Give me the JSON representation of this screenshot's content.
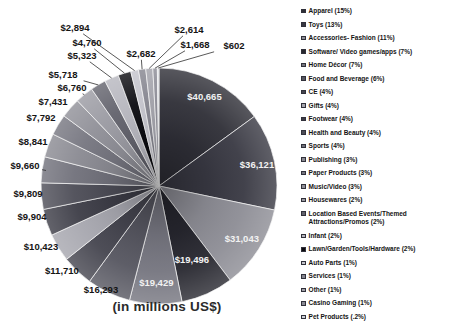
{
  "chart_data": {
    "type": "pie",
    "title": "(in millions US$)",
    "units": "millions US$",
    "total_value": 271638,
    "legend_position": "right",
    "slices": [
      {
        "name": "Apparel",
        "legend_label": "Apparel (15%)",
        "percent": "15%",
        "value": 40665,
        "value_label": "$40,665",
        "color": "#2e2e36",
        "label_inside": true
      },
      {
        "name": "Toys",
        "legend_label": "Toys (13%)",
        "percent": "13%",
        "value": 36121,
        "value_label": "$36,121",
        "color": "#383842",
        "label_inside": true
      },
      {
        "name": "Accessories- Fashion",
        "legend_label": "Accessories- Fashion (11%)",
        "percent": "11%",
        "value": 31043,
        "value_label": "$31,043",
        "color": "#8c8c94",
        "label_inside": true
      },
      {
        "name": "Software/ Video games/apps",
        "legend_label": "Software/ Video games/apps (7%)",
        "percent": "7%",
        "value": 19496,
        "value_label": "$19,496",
        "color": "#26262e",
        "label_inside": true
      },
      {
        "name": "Home Décor",
        "legend_label": "Home Décor (7%)",
        "percent": "7%",
        "value": 19429,
        "value_label": "$19,429",
        "color": "#74747e",
        "label_inside": true
      },
      {
        "name": "Food and Beverage",
        "legend_label": "Food and Beverage (6%)",
        "percent": "6%",
        "value": 16293,
        "value_label": "$16,293",
        "color": "#55555f",
        "label_inside": false
      },
      {
        "name": "CE",
        "legend_label": "CE (4%)",
        "percent": "4%",
        "value": 11710,
        "value_label": "$11,710",
        "color": "#44444e",
        "label_inside": false
      },
      {
        "name": "Gifts",
        "legend_label": "Gifts (4%)",
        "percent": "4%",
        "value": 10423,
        "value_label": "$10,423",
        "color": "#a6a6ae",
        "label_inside": false
      },
      {
        "name": "Footwear",
        "legend_label": "Footwear (4%)",
        "percent": "4%",
        "value": 9904,
        "value_label": "$9,904",
        "color": "#3c3c46",
        "label_inside": false
      },
      {
        "name": "Health and Beauty",
        "legend_label": "Health and Beauty (4%)",
        "percent": "4%",
        "value": 9809,
        "value_label": "$9,809",
        "color": "#4c4c56",
        "label_inside": false
      },
      {
        "name": "Sports",
        "legend_label": "Sports (4%)",
        "percent": "4%",
        "value": 9660,
        "value_label": "$9,660",
        "color": "#70707a",
        "label_inside": false
      },
      {
        "name": "Publishing",
        "legend_label": "Publishing (3%)",
        "percent": "3%",
        "value": 8841,
        "value_label": "$8,841",
        "color": "#898991",
        "label_inside": false
      },
      {
        "name": "Paper Products",
        "legend_label": "Paper Products (3%)",
        "percent": "3%",
        "value": 7792,
        "value_label": "$7,792",
        "color": "#75757f",
        "label_inside": false
      },
      {
        "name": "Music/Video",
        "legend_label": "Music/Video (3%)",
        "percent": "3%",
        "value": 7431,
        "value_label": "$7,431",
        "color": "#8f8f97",
        "label_inside": false
      },
      {
        "name": "Housewares",
        "legend_label": "Housewares (2%)",
        "percent": "2%",
        "value": 6760,
        "value_label": "$6,760",
        "color": "#9a9aa2",
        "label_inside": false
      },
      {
        "name": "Location Based Events/Themed Attractions/Promos",
        "legend_label": "Location Based Events/Themed Attractions/Promos (2%)",
        "percent": "2%",
        "value": 5718,
        "value_label": "$5,718",
        "color": "#62626c",
        "label_inside": false
      },
      {
        "name": "Infant",
        "legend_label": "Infant (2%)",
        "percent": "2%",
        "value": 5323,
        "value_label": "$5,323",
        "color": "#b6b6be",
        "label_inside": false
      },
      {
        "name": "Lawn/Garden/Tools/Hardware",
        "legend_label": "Lawn/Garden/Tools/Hardware (2%)",
        "percent": "2%",
        "value": 4760,
        "value_label": "$4,760",
        "color": "#0b0b10",
        "label_inside": false
      },
      {
        "name": "Auto Parts",
        "legend_label": "Auto Parts (1%)",
        "percent": "1%",
        "value": 2894,
        "value_label": "$2,894",
        "color": "#c3c3cb",
        "label_inside": false
      },
      {
        "name": "Services",
        "legend_label": "Services (1%)",
        "percent": "1%",
        "value": 2682,
        "value_label": "$2,682",
        "color": "#84848e",
        "label_inside": false
      },
      {
        "name": "Other",
        "legend_label": "Other (1%)",
        "percent": "1%",
        "value": 2614,
        "value_label": "$2,614",
        "color": "#a0a0a8",
        "label_inside": false
      },
      {
        "name": "Casino Gaming",
        "legend_label": "Casino Gaming (1%)",
        "percent": "1%",
        "value": 1668,
        "value_label": "$1,668",
        "color": "#8a8a94",
        "label_inside": false
      },
      {
        "name": "Pet Products",
        "legend_label": "Pet Products (.2%)",
        "percent": ".2%",
        "value": 602,
        "value_label": "$602",
        "color": "#ced1d7",
        "label_inside": false
      }
    ]
  }
}
